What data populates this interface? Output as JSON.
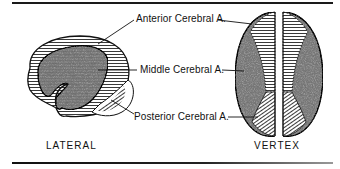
{
  "figure": {
    "labels": {
      "anterior": "Anterior Cerebral A.",
      "middle": "Middle Cerebral A.",
      "posterior": "Posterior Cerebral A."
    },
    "views": {
      "lateral": "LATERAL",
      "vertex": "VERTEX"
    },
    "colors": {
      "ink": "#111111",
      "middle_territory": "#8a8a8a",
      "background": "#ffffff"
    }
  }
}
